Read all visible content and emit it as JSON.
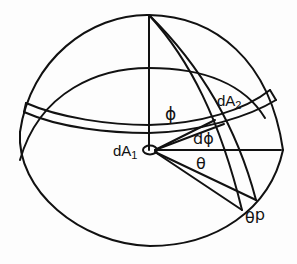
{
  "figure": {
    "colors": {
      "stroke": "#111111",
      "background": "#fdfdfd"
    }
  },
  "labels": {
    "phi": "ϕ",
    "dA2_main": "dA",
    "dA2_sub": "2",
    "dphi": "dϕ",
    "dA1_main": "dA",
    "dA1_sub": "1",
    "theta": "θ",
    "dtheta": "dθ"
  }
}
